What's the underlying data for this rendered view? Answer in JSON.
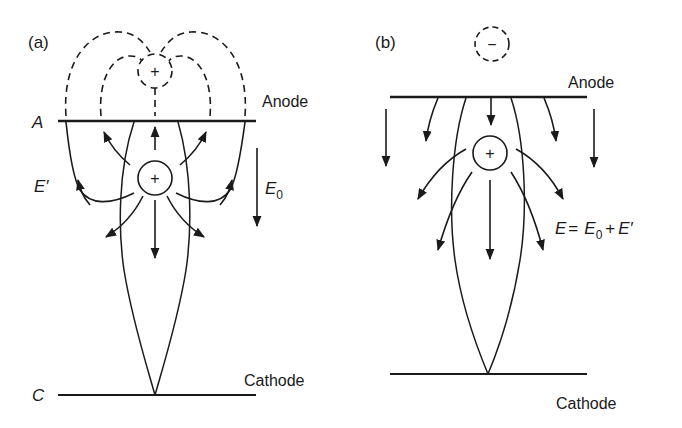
{
  "panels": {
    "a": {
      "label": "(a)",
      "anode_label": "Anode",
      "anode_symbol": "A",
      "cathode_label": "Cathode",
      "cathode_symbol": "C",
      "real_charge_sign": "+",
      "image_charge_sign": "+",
      "field_label_space_charge": "E′",
      "field_label_applied_main": "E",
      "field_label_applied_sub": "0"
    },
    "b": {
      "label": "(b)",
      "anode_label": "Anode",
      "cathode_label": "Cathode",
      "real_charge_sign": "+",
      "image_charge_sign": "−",
      "eq_E": "E",
      "eq_equals": "=",
      "eq_E0_main": "E",
      "eq_E0_sub": "0",
      "eq_plus": "+",
      "eq_Eprime": "E′"
    }
  },
  "colors": {
    "ink": "#1a1a1a",
    "background": "#ffffff"
  }
}
